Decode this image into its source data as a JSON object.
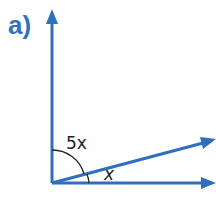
{
  "part_label": "a)",
  "angles": {
    "upper": "5x",
    "lower": "x"
  },
  "colors": {
    "line": "#2f6fbf",
    "label": "#2f72c0",
    "arc": "#222222"
  }
}
